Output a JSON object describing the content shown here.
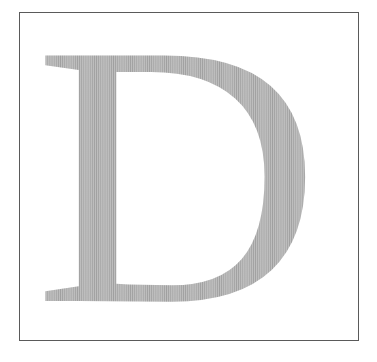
{
  "figure": {
    "letter": "D",
    "colors": {
      "page_background": "#ffffff",
      "frame_border": "#5a5a5a",
      "halftone_dot": "#c4c4c4",
      "letter_average_tint": "#e3e3e3"
    }
  }
}
